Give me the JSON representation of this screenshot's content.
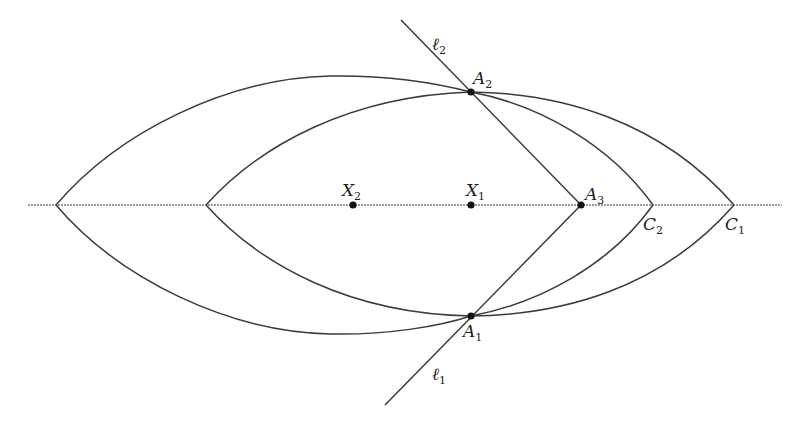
{
  "diagram": {
    "type": "geometry",
    "axis": {
      "y": 205,
      "x_start": 28,
      "x_end": 782
    },
    "points": {
      "X1": {
        "label": "X",
        "sub": "1",
        "x": 471,
        "y": 205
      },
      "X2": {
        "label": "X",
        "sub": "2",
        "x": 353,
        "y": 205
      },
      "A1": {
        "label": "A",
        "sub": "1",
        "x": 471,
        "y": 316
      },
      "A2": {
        "label": "A",
        "sub": "2",
        "x": 471,
        "y": 92
      },
      "A3": {
        "label": "A",
        "sub": "3",
        "x": 581,
        "y": 205
      },
      "C1": {
        "label": "C",
        "sub": "1",
        "x": 734,
        "y": 205
      },
      "C2": {
        "label": "C",
        "sub": "2",
        "x": 653,
        "y": 205
      }
    },
    "lines": {
      "l1": {
        "label": "ℓ",
        "sub": "1"
      },
      "l2": {
        "label": "ℓ",
        "sub": "2"
      }
    },
    "labels": {
      "X1": "X",
      "X1_sub": "1",
      "X2": "X",
      "X2_sub": "2",
      "A1": "A",
      "A1_sub": "1",
      "A2": "A",
      "A2_sub": "2",
      "A3": "A",
      "A3_sub": "3",
      "C1": "C",
      "C1_sub": "1",
      "C2": "C",
      "C2_sub": "2",
      "l1": "ℓ",
      "l1_sub": "1",
      "l2": "ℓ",
      "l2_sub": "2"
    },
    "colors": {
      "stroke": "#3a3a3a",
      "axis": "#7a7a7a",
      "point": "#111111",
      "background": "#ffffff"
    }
  }
}
